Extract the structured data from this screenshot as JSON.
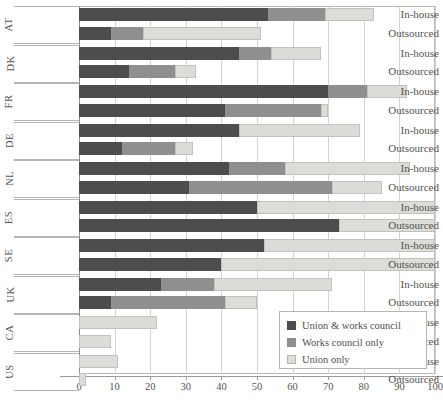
{
  "chart_data": {
    "type": "bar",
    "orientation": "horizontal",
    "stacked": true,
    "title": "",
    "xlabel": "",
    "ylabel": "",
    "xlim": [
      0,
      100
    ],
    "xticks": [
      0,
      10,
      20,
      30,
      40,
      50,
      60,
      70,
      80,
      90,
      100
    ],
    "grid": true,
    "legend_position": "bottom-right",
    "legend": [
      "Union & works council",
      "Works council only",
      "Union only"
    ],
    "series": [
      {
        "name": "Union & works council",
        "color": "#4d4d4d",
        "values": [
          53,
          9,
          45,
          14,
          70,
          41,
          45,
          12,
          42,
          31,
          50,
          73,
          52,
          40,
          23,
          9,
          0,
          0,
          0,
          0
        ]
      },
      {
        "name": "Works council only",
        "color": "#8f8f8f",
        "values": [
          16,
          9,
          9,
          13,
          11,
          27,
          0,
          15,
          16,
          40,
          0,
          0,
          0,
          0,
          15,
          32,
          0,
          0,
          0,
          0
        ]
      },
      {
        "name": "Union only",
        "color": "#dcdcd8",
        "values": [
          14,
          33,
          14,
          6,
          11,
          2,
          34,
          5,
          35,
          14,
          50,
          27,
          48,
          60,
          33,
          9,
          22,
          9,
          11,
          2
        ]
      }
    ],
    "categories": [
      {
        "country": "AT",
        "mode": "In-house"
      },
      {
        "country": "AT",
        "mode": "Outsourced"
      },
      {
        "country": "DK",
        "mode": "In-house"
      },
      {
        "country": "DK",
        "mode": "Outsourced"
      },
      {
        "country": "FR",
        "mode": "In-house"
      },
      {
        "country": "FR",
        "mode": "Outsourced"
      },
      {
        "country": "DE",
        "mode": "In-house"
      },
      {
        "country": "DE",
        "mode": "Outsourced"
      },
      {
        "country": "NL",
        "mode": "In-house"
      },
      {
        "country": "NL",
        "mode": "Outsourced"
      },
      {
        "country": "ES",
        "mode": "In-house"
      },
      {
        "country": "ES",
        "mode": "Outsourced"
      },
      {
        "country": "SE",
        "mode": "In-house"
      },
      {
        "country": "SE",
        "mode": "Outsourced"
      },
      {
        "country": "UK",
        "mode": "In-house"
      },
      {
        "country": "UK",
        "mode": "Outsourced"
      },
      {
        "country": "CA",
        "mode": "In-house"
      },
      {
        "country": "CA",
        "mode": "Outsourced"
      },
      {
        "country": "US",
        "mode": "In-house"
      },
      {
        "country": "US",
        "mode": "Outsourced"
      }
    ],
    "country_groups": [
      "AT",
      "DK",
      "FR",
      "DE",
      "NL",
      "ES",
      "SE",
      "UK",
      "CA",
      "US"
    ]
  }
}
